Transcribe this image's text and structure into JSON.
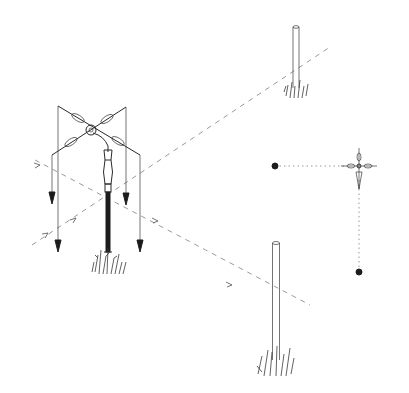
{
  "figure": {
    "colors": {
      "background": "#ffffff",
      "ink": "#2a2a2a",
      "guide_line": "#9a9a9a",
      "marker": "#1c1c1c"
    },
    "elements": {
      "groma": {
        "x": 105,
        "y": 100,
        "crossarm_span": 90,
        "plumb_bobs": 4
      },
      "post_far": {
        "x": 300,
        "top_y": 27,
        "bottom_y": 92
      },
      "post_near": {
        "x": 274,
        "top_y": 242,
        "bottom_y": 370
      },
      "plan_view_cross": {
        "x": 358,
        "y": 165
      },
      "marker_left": {
        "x": 275,
        "y": 166
      },
      "marker_bottom": {
        "x": 359,
        "y": 272
      }
    }
  }
}
